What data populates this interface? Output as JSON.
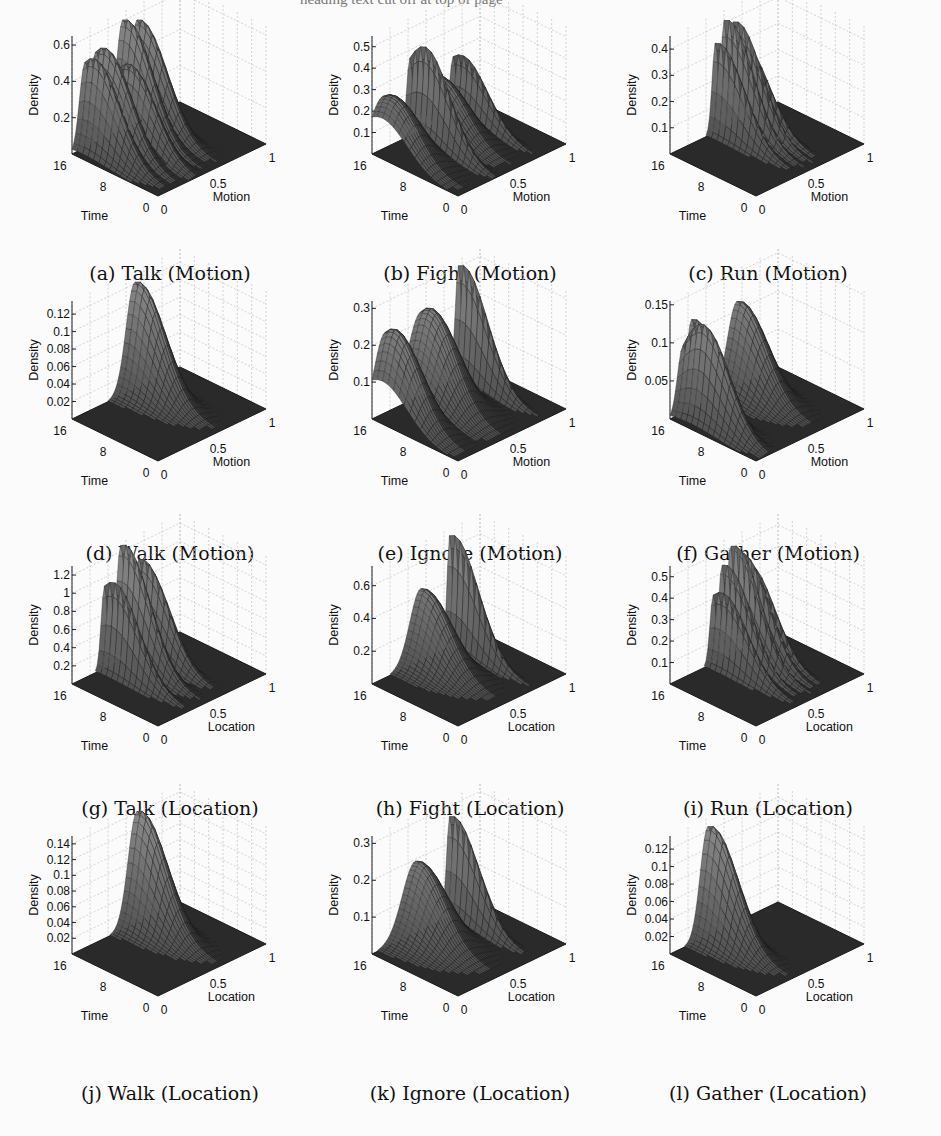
{
  "header": {
    "text": "heading text cut off at top of page"
  },
  "chart_data": [
    {
      "id": "a",
      "type": "surface3d",
      "caption": "(a) Talk (Motion)",
      "zlabel": "Density",
      "xlabel": "Motion",
      "ylabel": "Time",
      "zticks": [
        "0.2",
        "0.4",
        "0.6"
      ],
      "zmax": 0.65,
      "xticks": [
        "0",
        "0.5",
        "1"
      ],
      "yticks": [
        "0",
        "8",
        "16"
      ],
      "peaks": [
        {
          "x": 0.12,
          "y": 14,
          "h": 0.52,
          "w": 0.05
        },
        {
          "x": 0.22,
          "y": 14,
          "h": 0.55,
          "w": 0.06
        },
        {
          "x": 0.35,
          "y": 12,
          "h": 0.45,
          "w": 0.05
        },
        {
          "x": 0.47,
          "y": 15,
          "h": 0.62,
          "w": 0.06
        },
        {
          "x": 0.6,
          "y": 15,
          "h": 0.58,
          "w": 0.06
        }
      ]
    },
    {
      "id": "b",
      "type": "surface3d",
      "caption": "(b) Fight (Motion)",
      "zlabel": "Density",
      "xlabel": "Motion",
      "ylabel": "Time",
      "zticks": [
        "0.1",
        "0.2",
        "0.3",
        "0.4",
        "0.5"
      ],
      "zmax": 0.55,
      "xticks": [
        "0",
        "0.5",
        "1"
      ],
      "yticks": [
        "0",
        "8",
        "16"
      ],
      "peaks": [
        {
          "x": 0.1,
          "y": 14,
          "h": 0.27,
          "w": 0.12
        },
        {
          "x": 0.35,
          "y": 13,
          "h": 0.45,
          "w": 0.03
        },
        {
          "x": 0.55,
          "y": 14,
          "h": 0.25,
          "w": 0.1
        },
        {
          "x": 0.75,
          "y": 14,
          "h": 0.3,
          "w": 0.03
        }
      ]
    },
    {
      "id": "c",
      "type": "surface3d",
      "caption": "(c) Run (Motion)",
      "zlabel": "Density",
      "xlabel": "Motion",
      "ylabel": "Time",
      "zticks": [
        "0.1",
        "0.2",
        "0.3",
        "0.4"
      ],
      "zmax": 0.45,
      "xticks": [
        "0",
        "0.5",
        "1"
      ],
      "yticks": [
        "0",
        "8",
        "16"
      ],
      "peaks": [
        {
          "x": 0.42,
          "y": 15,
          "h": 0.35,
          "w": 0.03
        },
        {
          "x": 0.5,
          "y": 15,
          "h": 0.42,
          "w": 0.03
        },
        {
          "x": 0.58,
          "y": 15,
          "h": 0.4,
          "w": 0.03
        },
        {
          "x": 0.65,
          "y": 15,
          "h": 0.3,
          "w": 0.03
        }
      ]
    },
    {
      "id": "d",
      "type": "surface3d",
      "caption": "(d) Walk (Motion)",
      "zlabel": "Density",
      "xlabel": "Motion",
      "ylabel": "Time",
      "zticks": [
        "0.02",
        "0.04",
        "0.06",
        "0.08",
        "0.1",
        "0.12"
      ],
      "zmax": 0.135,
      "xticks": [
        "0",
        "0.5",
        "1"
      ],
      "yticks": [
        "0",
        "8",
        "16"
      ],
      "peaks": [
        {
          "x": 0.58,
          "y": 15,
          "h": 0.125,
          "w": 0.08
        }
      ]
    },
    {
      "id": "e",
      "type": "surface3d",
      "caption": "(e) Ignore (Motion)",
      "zlabel": "Density",
      "xlabel": "Motion",
      "ylabel": "Time",
      "zticks": [
        "0.1",
        "0.2",
        "0.3"
      ],
      "zmax": 0.32,
      "xticks": [
        "0",
        "0.5",
        "1"
      ],
      "yticks": [
        "0",
        "8",
        "16"
      ],
      "peaks": [
        {
          "x": 0.12,
          "y": 14,
          "h": 0.24,
          "w": 0.1
        },
        {
          "x": 0.45,
          "y": 14,
          "h": 0.25,
          "w": 0.12
        },
        {
          "x": 0.8,
          "y": 15,
          "h": 0.31,
          "w": 0.03
        }
      ]
    },
    {
      "id": "f",
      "type": "surface3d",
      "caption": "(f) Gather (Motion)",
      "zlabel": "Density",
      "xlabel": "Motion",
      "ylabel": "Time",
      "zticks": [
        "0.05",
        "0.1",
        "0.15"
      ],
      "zmax": 0.155,
      "xticks": [
        "0",
        "0.5",
        "1"
      ],
      "yticks": [
        "0",
        "8",
        "16"
      ],
      "peaks": [
        {
          "x": 0.12,
          "y": 12,
          "h": 0.13,
          "w": 0.05
        },
        {
          "x": 0.2,
          "y": 15,
          "h": 0.12,
          "w": 0.05
        },
        {
          "x": 0.62,
          "y": 15,
          "h": 0.115,
          "w": 0.09
        }
      ]
    },
    {
      "id": "g",
      "type": "surface3d",
      "caption": "(g) Talk (Location)",
      "zlabel": "Density",
      "xlabel": "Location",
      "ylabel": "Time",
      "zticks": [
        "0.2",
        "0.4",
        "0.6",
        "0.8",
        "1",
        "1.2"
      ],
      "zmax": 1.3,
      "xticks": [
        "0",
        "0.5",
        "1"
      ],
      "yticks": [
        "0",
        "8",
        "16"
      ],
      "peaks": [
        {
          "x": 0.3,
          "y": 14,
          "h": 1.0,
          "w": 0.03
        },
        {
          "x": 0.45,
          "y": 15,
          "h": 1.3,
          "w": 0.04
        },
        {
          "x": 0.62,
          "y": 15,
          "h": 1.05,
          "w": 0.04
        }
      ]
    },
    {
      "id": "h",
      "type": "surface3d",
      "caption": "(h) Fight (Location)",
      "zlabel": "Density",
      "xlabel": "Location",
      "ylabel": "Time",
      "zticks": [
        "0.2",
        "0.4",
        "0.6"
      ],
      "zmax": 0.72,
      "xticks": [
        "0",
        "0.5",
        "1"
      ],
      "yticks": [
        "0",
        "8",
        "16"
      ],
      "peaks": [
        {
          "x": 0.45,
          "y": 15,
          "h": 0.45,
          "w": 0.1
        },
        {
          "x": 0.72,
          "y": 15,
          "h": 0.7,
          "w": 0.025
        }
      ]
    },
    {
      "id": "i",
      "type": "surface3d",
      "caption": "(i) Run (Location)",
      "zlabel": "Density",
      "xlabel": "Location",
      "ylabel": "Time",
      "zticks": [
        "0.1",
        "0.2",
        "0.3",
        "0.4",
        "0.5"
      ],
      "zmax": 0.55,
      "xticks": [
        "0",
        "0.5",
        "1"
      ],
      "yticks": [
        "0",
        "8",
        "16"
      ],
      "peaks": [
        {
          "x": 0.4,
          "y": 14,
          "h": 0.35,
          "w": 0.03
        },
        {
          "x": 0.48,
          "y": 15,
          "h": 0.45,
          "w": 0.03
        },
        {
          "x": 0.56,
          "y": 15,
          "h": 0.53,
          "w": 0.03
        },
        {
          "x": 0.64,
          "y": 15,
          "h": 0.48,
          "w": 0.03
        },
        {
          "x": 0.7,
          "y": 15,
          "h": 0.4,
          "w": 0.03
        }
      ]
    },
    {
      "id": "j",
      "type": "surface3d",
      "caption": "(j) Walk (Location)",
      "zlabel": "Density",
      "xlabel": "Location",
      "ylabel": "Time",
      "zticks": [
        "0.02",
        "0.04",
        "0.06",
        "0.08",
        "0.1",
        "0.12",
        "0.14"
      ],
      "zmax": 0.15,
      "xticks": [
        "0",
        "0.5",
        "1"
      ],
      "yticks": [
        "0",
        "8",
        "16"
      ],
      "peaks": [
        {
          "x": 0.6,
          "y": 15,
          "h": 0.145,
          "w": 0.08
        }
      ]
    },
    {
      "id": "k",
      "type": "surface3d",
      "caption": "(k) Ignore (Location)",
      "zlabel": "Density",
      "xlabel": "Location",
      "ylabel": "Time",
      "zticks": [
        "0.1",
        "0.2",
        "0.3"
      ],
      "zmax": 0.32,
      "xticks": [
        "0",
        "0.5",
        "1"
      ],
      "yticks": [
        "0",
        "8",
        "16"
      ],
      "peaks": [
        {
          "x": 0.4,
          "y": 15,
          "h": 0.2,
          "w": 0.12
        },
        {
          "x": 0.72,
          "y": 15,
          "h": 0.28,
          "w": 0.03
        }
      ]
    },
    {
      "id": "l",
      "type": "surface3d",
      "caption": "(l) Gather (Location)",
      "zlabel": "Density",
      "xlabel": "Location",
      "ylabel": "Time",
      "zticks": [
        "0.02",
        "0.04",
        "0.06",
        "0.08",
        "0.1",
        "0.12"
      ],
      "zmax": 0.135,
      "xticks": [
        "0",
        "0.5",
        "1"
      ],
      "yticks": [
        "0",
        "8",
        "16"
      ],
      "peaks": [
        {
          "x": 0.35,
          "y": 15,
          "h": 0.128,
          "w": 0.07
        }
      ]
    }
  ]
}
